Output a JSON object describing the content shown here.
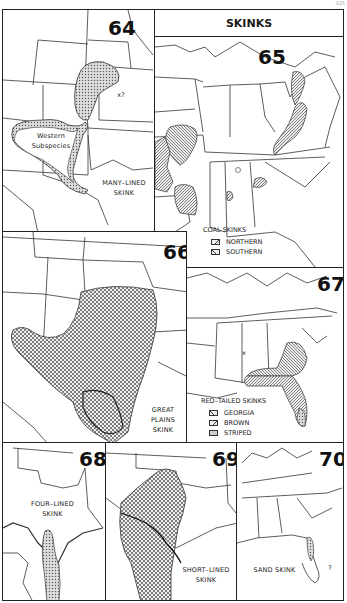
{
  "page": {
    "page_number": "325",
    "header_title": "SKINKS"
  },
  "colors": {
    "line": "#222222",
    "range_fill": "#bdbdbd",
    "background": "#ffffff"
  },
  "maps": [
    {
      "number": "64",
      "title": "MANY-LINED SKINK",
      "title_lines": [
        "MANY–LINED",
        "SKINK"
      ],
      "annotations": [
        "Western",
        "Subspecies",
        "x?"
      ]
    },
    {
      "number": "65",
      "title": "COAL SKINKS",
      "legend": {
        "title": "COAL SKINKS",
        "items": [
          {
            "pattern": "hatch-right",
            "label": "NORTHERN"
          },
          {
            "pattern": "hatch-left",
            "label": "SOUTHERN"
          }
        ]
      }
    },
    {
      "number": "66",
      "title": "GREAT PLAINS SKINK",
      "title_lines": [
        "GREAT",
        "PLAINS",
        "SKINK"
      ]
    },
    {
      "number": "67",
      "title": "RED-TAILED SKINKS",
      "legend": {
        "title": "RED–TAILED SKINKS",
        "items": [
          {
            "pattern": "hatch-left",
            "label": "GEORGIA"
          },
          {
            "pattern": "hatch-right",
            "label": "BROWN"
          },
          {
            "pattern": "dots",
            "label": "STRIPED"
          }
        ]
      },
      "annotations": [
        "x"
      ]
    },
    {
      "number": "68",
      "title": "FOUR-LINED SKINK",
      "title_lines": [
        "FOUR–LINED",
        "SKINK"
      ]
    },
    {
      "number": "69",
      "title": "SHORT-LINED SKINK",
      "title_lines": [
        "SHORT–LINED",
        "SKINK"
      ]
    },
    {
      "number": "70",
      "title": "SAND SKINK",
      "title_lines": [
        "SAND SKINK"
      ],
      "annotations": [
        "?"
      ]
    }
  ]
}
